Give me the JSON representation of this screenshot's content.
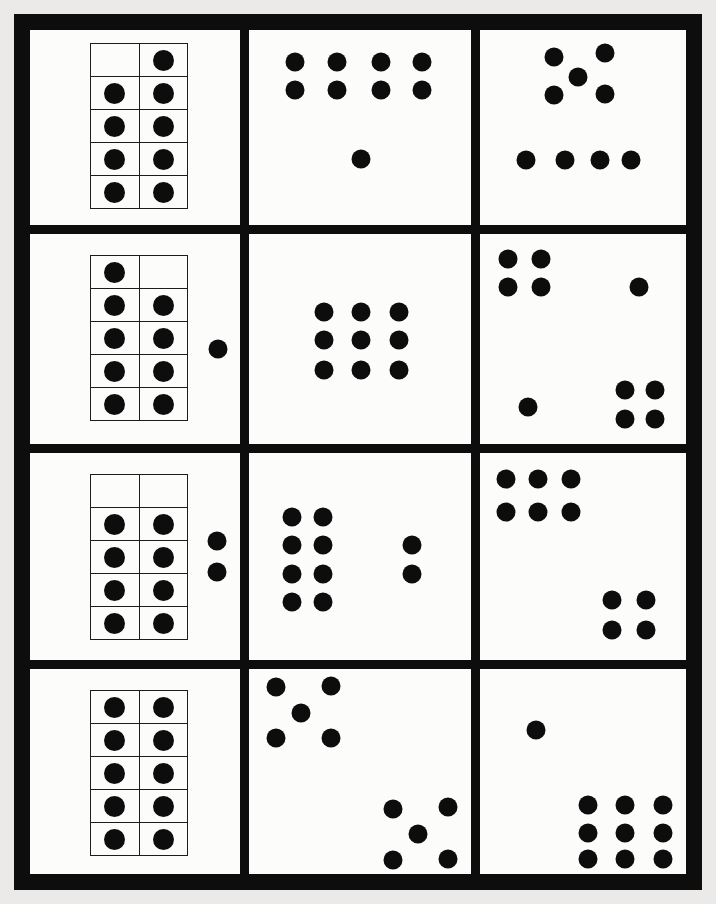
{
  "page": {
    "kind": "printable dot-card subitizing worksheet",
    "background_color": "#eceae8",
    "card_color": "#fcfcfa",
    "ink_color": "#0d0d0d",
    "grid_rows": 4,
    "grid_columns": 3
  },
  "cards": [
    {
      "id": "r1c1",
      "row": 1,
      "col": 1,
      "dot_count": 9,
      "arrangement": "vertical ten-frame showing 9 (top-left cell empty)",
      "ten_frame": {
        "columns": 2,
        "rows": 5,
        "filled": [
          [
            0,
            1
          ],
          [
            1,
            1
          ],
          [
            1,
            1
          ],
          [
            1,
            1
          ],
          [
            1,
            1
          ]
        ],
        "x": 60,
        "y": 13,
        "width": 98,
        "height": 166
      },
      "loose_dots": []
    },
    {
      "id": "r1c2",
      "row": 1,
      "col": 2,
      "dot_count": 9,
      "arrangement": "two rows of four plus one dot below",
      "loose_dots": [
        [
          20.7,
          16.4
        ],
        [
          39.6,
          16.4
        ],
        [
          59.5,
          16.4
        ],
        [
          77.9,
          16.4
        ],
        [
          20.7,
          30.8
        ],
        [
          39.6,
          30.8
        ],
        [
          59.5,
          30.8
        ],
        [
          77.9,
          30.8
        ],
        [
          50.5,
          66.2
        ]
      ]
    },
    {
      "id": "r1c3",
      "row": 1,
      "col": 3,
      "dot_count": 9,
      "arrangement": "dice-five pattern above a row of four",
      "loose_dots": [
        [
          36.0,
          13.8
        ],
        [
          60.7,
          11.8
        ],
        [
          47.6,
          24.1
        ],
        [
          36.0,
          33.3
        ],
        [
          60.7,
          32.8
        ],
        [
          22.3,
          66.7
        ],
        [
          41.3,
          66.7
        ],
        [
          58.3,
          66.7
        ],
        [
          73.3,
          66.7
        ]
      ]
    },
    {
      "id": "r2c1",
      "row": 2,
      "col": 1,
      "dot_count": 10,
      "arrangement": "vertical ten-frame showing 9 (top-right cell empty) plus one loose dot",
      "ten_frame": {
        "columns": 2,
        "rows": 5,
        "filled": [
          [
            1,
            0
          ],
          [
            1,
            1
          ],
          [
            1,
            1
          ],
          [
            1,
            1
          ],
          [
            1,
            1
          ]
        ],
        "x": 60,
        "y": 21,
        "width": 98,
        "height": 166
      },
      "loose_dots": [
        [
          89.5,
          54.8
        ]
      ]
    },
    {
      "id": "r2c2",
      "row": 2,
      "col": 2,
      "dot_count": 9,
      "arrangement": "three-by-three array",
      "loose_dots": [
        [
          33.8,
          37.1
        ],
        [
          50.5,
          37.1
        ],
        [
          67.6,
          37.1
        ],
        [
          33.8,
          50.5
        ],
        [
          50.5,
          50.5
        ],
        [
          67.6,
          50.5
        ],
        [
          33.8,
          64.8
        ],
        [
          50.5,
          64.8
        ],
        [
          67.6,
          64.8
        ]
      ]
    },
    {
      "id": "r2c3",
      "row": 2,
      "col": 3,
      "dot_count": 10,
      "arrangement": "four in top-left, one at right, one at bottom-left, four in bottom-right",
      "loose_dots": [
        [
          13.6,
          11.9
        ],
        [
          29.6,
          11.9
        ],
        [
          13.6,
          25.2
        ],
        [
          29.6,
          25.2
        ],
        [
          77.2,
          25.2
        ],
        [
          23.3,
          82.4
        ],
        [
          70.4,
          74.3
        ],
        [
          85.0,
          74.3
        ],
        [
          70.4,
          88.1
        ],
        [
          85.0,
          88.1
        ]
      ]
    },
    {
      "id": "r3c1",
      "row": 3,
      "col": 1,
      "dot_count": 10,
      "arrangement": "vertical ten-frame showing 8 (top row empty) plus two loose dots",
      "ten_frame": {
        "columns": 2,
        "rows": 5,
        "filled": [
          [
            0,
            0
          ],
          [
            1,
            1
          ],
          [
            1,
            1
          ],
          [
            1,
            1
          ],
          [
            1,
            1
          ]
        ],
        "x": 60,
        "y": 21,
        "width": 98,
        "height": 166
      },
      "loose_dots": [
        [
          89.0,
          42.5
        ],
        [
          89.0,
          57.5
        ]
      ]
    },
    {
      "id": "r3c2",
      "row": 3,
      "col": 2,
      "dot_count": 10,
      "arrangement": "two-by-four block plus a vertical pair at right",
      "loose_dots": [
        [
          19.4,
          30.9
        ],
        [
          33.3,
          30.9
        ],
        [
          19.4,
          44.4
        ],
        [
          33.3,
          44.4
        ],
        [
          19.4,
          58.5
        ],
        [
          33.3,
          58.5
        ],
        [
          19.4,
          72.0
        ],
        [
          33.3,
          72.0
        ],
        [
          73.4,
          44.4
        ],
        [
          73.4,
          58.5
        ]
      ]
    },
    {
      "id": "r3c3",
      "row": 3,
      "col": 3,
      "dot_count": 10,
      "arrangement": "six in top-left block, four in lower-right block",
      "loose_dots": [
        [
          12.6,
          12.6
        ],
        [
          28.2,
          12.6
        ],
        [
          44.2,
          12.6
        ],
        [
          12.6,
          28.5
        ],
        [
          28.2,
          28.5
        ],
        [
          44.2,
          28.5
        ],
        [
          64.1,
          71.0
        ],
        [
          80.6,
          71.0
        ],
        [
          64.1,
          85.5
        ],
        [
          80.6,
          85.5
        ]
      ]
    },
    {
      "id": "r4c1",
      "row": 4,
      "col": 1,
      "dot_count": 10,
      "arrangement": "full vertical ten-frame showing 10",
      "ten_frame": {
        "columns": 2,
        "rows": 5,
        "filled": [
          [
            1,
            1
          ],
          [
            1,
            1
          ],
          [
            1,
            1
          ],
          [
            1,
            1
          ],
          [
            1,
            1
          ]
        ],
        "x": 60,
        "y": 21,
        "width": 98,
        "height": 166
      },
      "loose_dots": []
    },
    {
      "id": "r4c2",
      "row": 4,
      "col": 2,
      "dot_count": 10,
      "arrangement": "dice-five pattern top-left and dice-five pattern bottom-right",
      "loose_dots": [
        [
          12.2,
          8.7
        ],
        [
          36.9,
          8.3
        ],
        [
          23.4,
          21.4
        ],
        [
          12.2,
          33.5
        ],
        [
          36.9,
          33.5
        ],
        [
          64.9,
          68.4
        ],
        [
          89.6,
          67.5
        ],
        [
          76.1,
          80.6
        ],
        [
          64.9,
          93.2
        ],
        [
          89.6,
          92.7
        ]
      ]
    },
    {
      "id": "r4c3",
      "row": 4,
      "col": 3,
      "dot_count": 10,
      "arrangement": "one dot top-left plus three-by-three array bottom-right",
      "loose_dots": [
        [
          27.2,
          29.6
        ],
        [
          52.4,
          66.5
        ],
        [
          70.4,
          66.5
        ],
        [
          88.8,
          66.5
        ],
        [
          52.4,
          80.1
        ],
        [
          70.4,
          80.1
        ],
        [
          88.8,
          80.1
        ],
        [
          52.4,
          92.7
        ],
        [
          70.4,
          92.7
        ],
        [
          88.8,
          92.7
        ]
      ]
    }
  ]
}
